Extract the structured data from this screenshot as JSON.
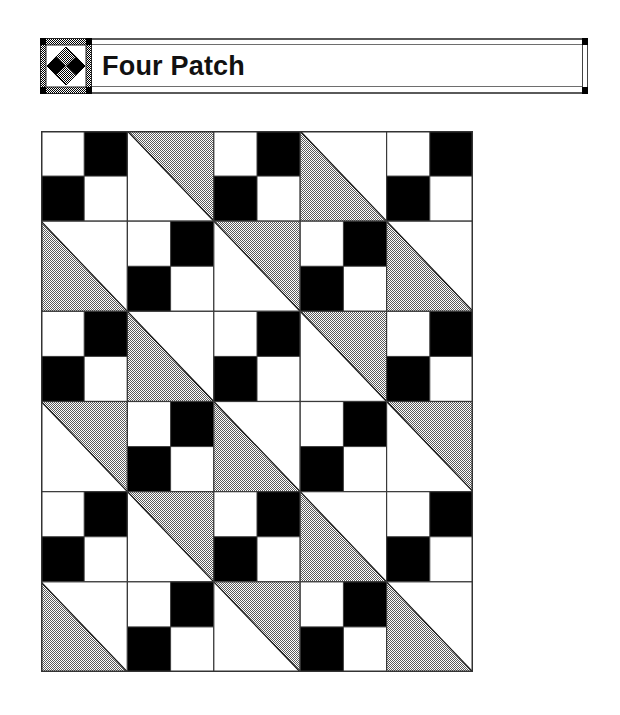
{
  "header": {
    "title": "Four Patch",
    "icon": "four-patch-diamond-block-icon"
  },
  "colors": {
    "dark": "#000000",
    "light": "#ffffff",
    "shaded": "#a8a8a8",
    "line": "#3a3a3a"
  },
  "quilt": {
    "columns": 5,
    "rows": 6,
    "legend": {
      "FP": "four-patch block (black top-right & bottom-left, white top-left & bottom-right)",
      "TR": "half-square triangle, diagonal top-left to bottom-right, upper-right half shaded",
      "BL": "half-square triangle, diagonal top-left to bottom-right, lower-left half shaded"
    },
    "layout": [
      [
        "FP",
        "TR",
        "FP",
        "BL",
        "FP"
      ],
      [
        "BL",
        "FP",
        "TR",
        "FP",
        "BL"
      ],
      [
        "FP",
        "BL",
        "FP",
        "TR",
        "FP"
      ],
      [
        "TR",
        "FP",
        "BL",
        "FP",
        "TR"
      ],
      [
        "FP",
        "TR",
        "FP",
        "BL",
        "FP"
      ],
      [
        "BL",
        "FP",
        "TR",
        "FP",
        "BL"
      ]
    ]
  }
}
